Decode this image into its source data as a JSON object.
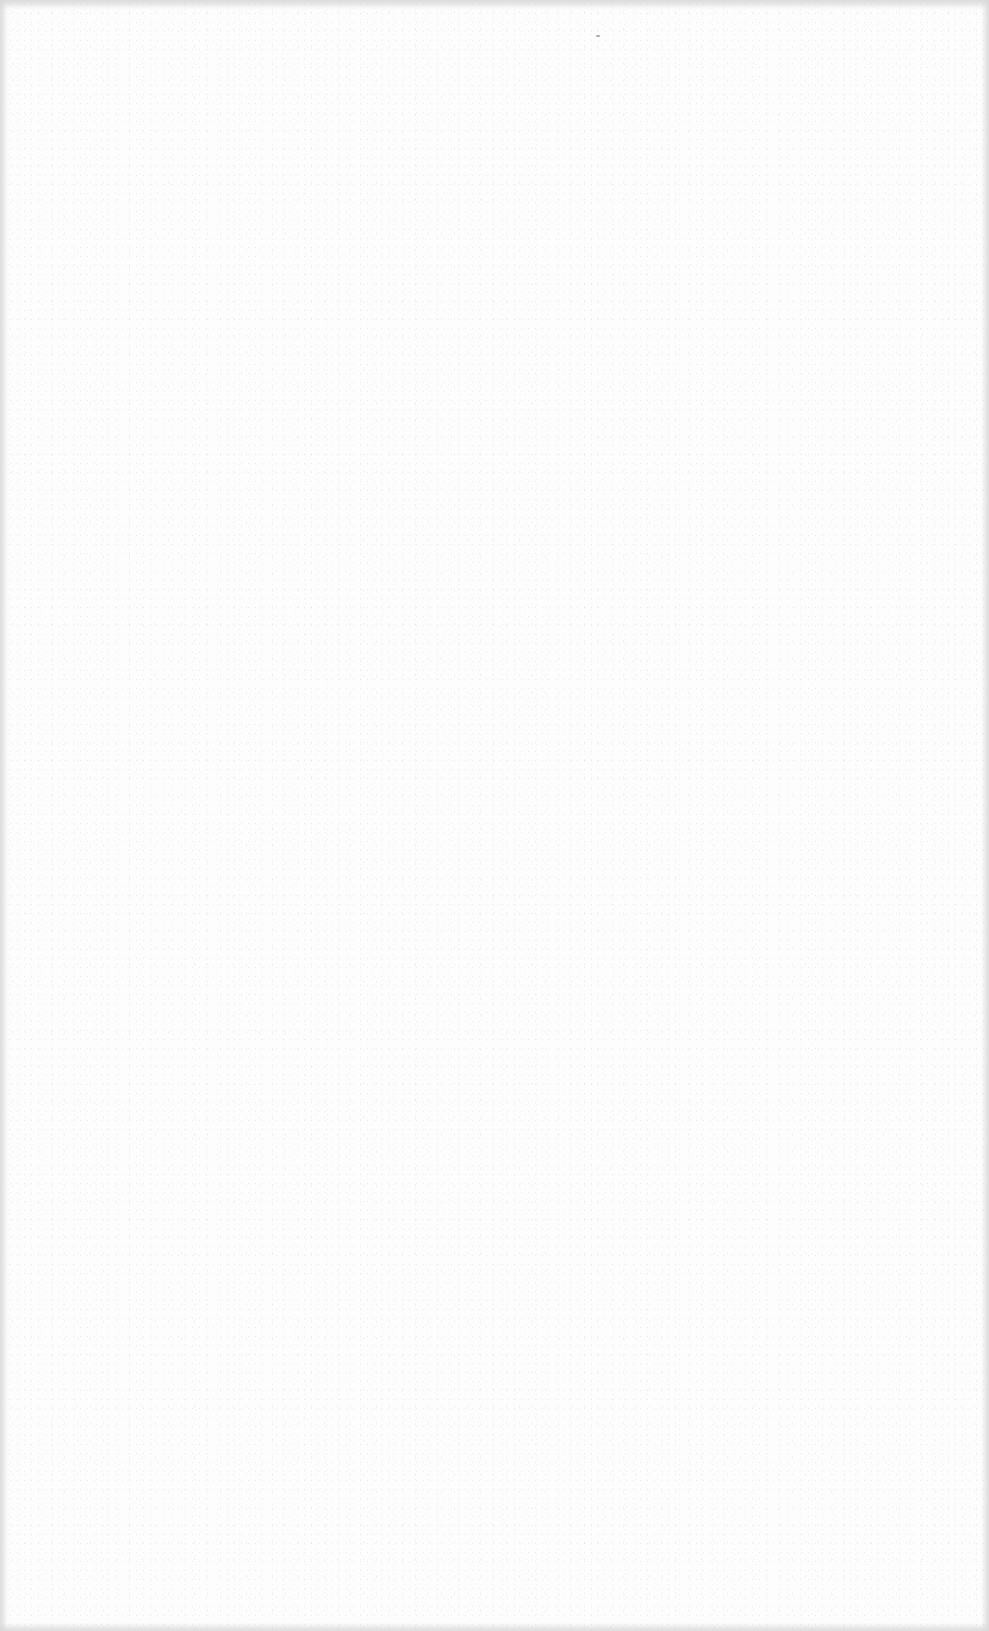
{
  "page": {
    "type": "blank-scanned-page",
    "background_color": "#fdfdfd",
    "noise_color": "#b4b4b4",
    "edge_shade_color": "#d7d7d7",
    "text_content": []
  }
}
